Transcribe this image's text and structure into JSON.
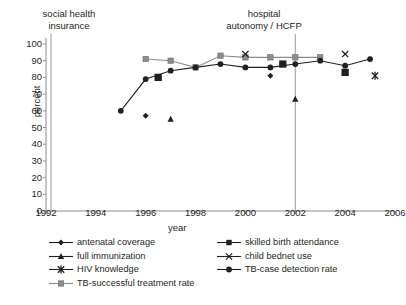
{
  "annotations": {
    "social_health_insurance": "social health\ninsurance",
    "hospital_autonomy": "hospital\nautonomy / HCFP",
    "shi_line_1": "social health",
    "shi_line_2": "insurance",
    "hosp_line_1": "hospital",
    "hosp_line_2": "autonomy / HCFP"
  },
  "axes": {
    "ylabel": "percent",
    "xlabel": "year",
    "yticks": [
      0,
      10,
      20,
      30,
      40,
      50,
      60,
      70,
      80,
      90,
      100
    ],
    "xticks": [
      1992,
      1994,
      1996,
      1998,
      2000,
      2002,
      2004,
      2006
    ]
  },
  "legend": {
    "left": [
      {
        "label": "antenatal coverage",
        "marker": "diamond",
        "color": "#231f20"
      },
      {
        "label": "full immunization",
        "marker": "triangle",
        "color": "#231f20"
      },
      {
        "label": "HIV knowledge",
        "marker": "asterisk",
        "color": "#231f20"
      },
      {
        "label": "TB-successful treatment rate",
        "marker": "square",
        "color": "#8c8c8c"
      }
    ],
    "right": [
      {
        "label": "skilled birth attendance",
        "marker": "square",
        "color": "#231f20"
      },
      {
        "label": "child bednet use",
        "marker": "cross",
        "color": "#231f20"
      },
      {
        "label": "TB-case detection rate",
        "marker": "circle",
        "color": "#231f20"
      }
    ]
  },
  "chart_data": {
    "type": "line",
    "title": "",
    "xlabel": "year",
    "ylabel": "percent",
    "xlim": [
      1992,
      2006
    ],
    "ylim": [
      0,
      100
    ],
    "grid": false,
    "legend_position": "below",
    "vertical_markers": [
      {
        "x": 1992.2,
        "label": "social health insurance"
      },
      {
        "x": 2002,
        "label": "hospital autonomy / HCFP"
      }
    ],
    "series": [
      {
        "name": "TB-case detection rate",
        "marker": "circle",
        "color": "#231f20",
        "connected": true,
        "points": [
          {
            "x": 1995,
            "y": 60
          },
          {
            "x": 1996,
            "y": 79
          },
          {
            "x": 1997,
            "y": 84
          },
          {
            "x": 1998,
            "y": 86
          },
          {
            "x": 1999,
            "y": 88
          },
          {
            "x": 2000,
            "y": 86
          },
          {
            "x": 2001,
            "y": 86
          },
          {
            "x": 2002,
            "y": 88
          },
          {
            "x": 2003,
            "y": 90
          },
          {
            "x": 2004,
            "y": 87
          },
          {
            "x": 2005,
            "y": 91
          }
        ]
      },
      {
        "name": "TB-successful treatment rate",
        "marker": "square",
        "color": "#8c8c8c",
        "connected": true,
        "points": [
          {
            "x": 1996,
            "y": 91
          },
          {
            "x": 1997,
            "y": 90
          },
          {
            "x": 1998,
            "y": 86
          },
          {
            "x": 1999,
            "y": 93
          },
          {
            "x": 2000,
            "y": 92
          },
          {
            "x": 2001,
            "y": 92
          },
          {
            "x": 2002,
            "y": 92
          },
          {
            "x": 2003,
            "y": 92
          }
        ]
      },
      {
        "name": "skilled birth attendance",
        "marker": "square",
        "color": "#231f20",
        "connected": false,
        "points": [
          {
            "x": 1996.5,
            "y": 80
          },
          {
            "x": 2001.5,
            "y": 88
          },
          {
            "x": 2004,
            "y": 83
          }
        ]
      },
      {
        "name": "child bednet use",
        "marker": "cross",
        "color": "#231f20",
        "connected": false,
        "points": [
          {
            "x": 2000,
            "y": 94
          },
          {
            "x": 2004,
            "y": 94
          }
        ]
      },
      {
        "name": "antenatal coverage",
        "marker": "diamond",
        "color": "#231f20",
        "connected": false,
        "points": [
          {
            "x": 1996,
            "y": 57
          },
          {
            "x": 2001,
            "y": 81
          }
        ]
      },
      {
        "name": "full immunization",
        "marker": "triangle",
        "color": "#231f20",
        "connected": false,
        "points": [
          {
            "x": 1997,
            "y": 55
          },
          {
            "x": 2002,
            "y": 67
          }
        ]
      },
      {
        "name": "HIV knowledge",
        "marker": "asterisk",
        "color": "#231f20",
        "connected": false,
        "points": [
          {
            "x": 2005.2,
            "y": 81
          }
        ]
      }
    ]
  }
}
